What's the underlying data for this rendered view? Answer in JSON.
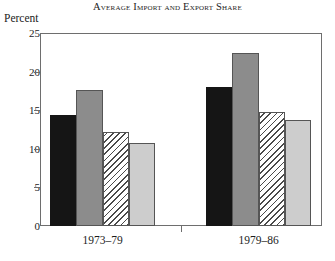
{
  "chart_data": {
    "type": "bar",
    "title": "Average Import and Export Share",
    "xlabel": "",
    "ylabel": "Percent",
    "ylim": [
      0,
      25
    ],
    "yticks": [
      0,
      5,
      10,
      15,
      20,
      25
    ],
    "ytick_labels": [
      "0",
      "5",
      "10",
      "15",
      "20",
      "25"
    ],
    "grid": false,
    "legend": "none",
    "categories": [
      "1973–79",
      "1979–86"
    ],
    "series": [
      {
        "name": "series-1",
        "style": "black",
        "values": [
          14.4,
          18.0
        ]
      },
      {
        "name": "series-2",
        "style": "midgray",
        "values": [
          17.6,
          22.4
        ]
      },
      {
        "name": "series-3",
        "style": "hatch",
        "values": [
          12.2,
          14.8
        ]
      },
      {
        "name": "series-4",
        "style": "lightgray",
        "values": [
          10.7,
          13.7
        ]
      }
    ]
  },
  "axes": {
    "unit_label": "Percent"
  }
}
